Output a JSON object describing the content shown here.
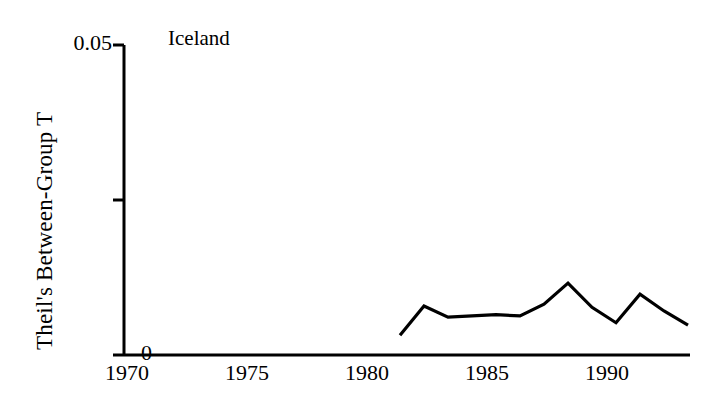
{
  "chart_data": {
    "type": "line",
    "title": "Iceland",
    "xlabel": "",
    "ylabel": "Theil's Between-Group T",
    "xlim": [
      1970,
      1993.5
    ],
    "ylim": [
      0,
      0.05
    ],
    "grid": false,
    "legend": "none",
    "x_ticks": [
      "1970",
      "1975",
      "1980",
      "1985",
      "1990"
    ],
    "x_tick_values": [
      1970,
      1975,
      1980,
      1985,
      1990
    ],
    "y_ticks": [
      "0",
      "0.05"
    ],
    "y_tick_values": [
      0,
      0.05
    ],
    "y_minor_tick_values": [
      0.025
    ],
    "series": [
      {
        "name": "Iceland",
        "color": "#000000",
        "x": [
          1981.5,
          1982.5,
          1983.5,
          1984.5,
          1985.5,
          1986.5,
          1987.5,
          1988.5,
          1989.5,
          1990.5,
          1991.5,
          1992.5,
          1993.5
        ],
        "values": [
          0.0032,
          0.0079,
          0.0061,
          0.0063,
          0.0065,
          0.0063,
          0.0082,
          0.0116,
          0.0077,
          0.0052,
          0.0098,
          0.0071,
          0.0048
        ]
      }
    ]
  },
  "figure": {
    "title": "Iceland",
    "ylabel": "Theil's Between-Group T",
    "ytick_top": "0.05",
    "ytick_bottom": "0",
    "xtick_1": "1970",
    "xtick_2": "1975",
    "xtick_3": "1980",
    "xtick_4": "1985",
    "xtick_5": "1990",
    "axis_color": "#000000",
    "line_color": "#000000",
    "background": "#ffffff"
  }
}
